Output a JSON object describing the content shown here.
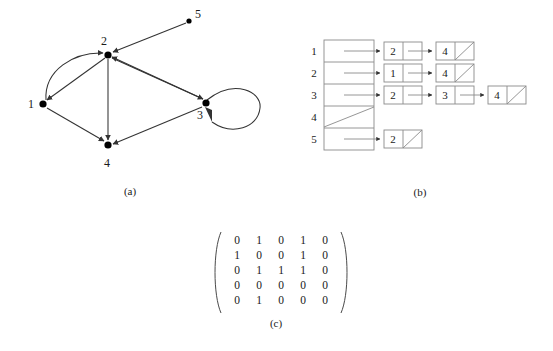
{
  "figure": {
    "captions": {
      "a": "(a)",
      "b": "(b)",
      "c": "(c)"
    },
    "colors": {
      "stroke": "#4a4a4a",
      "node_fill": "#000000",
      "text": "#1a1a1a",
      "background": "#ffffff"
    }
  },
  "graph": {
    "nodes": [
      {
        "id": "1",
        "label": "1",
        "x": 43,
        "y": 104,
        "label_x": 31,
        "label_y": 107
      },
      {
        "id": "2",
        "label": "2",
        "x": 108,
        "y": 55,
        "label_x": 103,
        "label_y": 44
      },
      {
        "id": "3",
        "label": "3",
        "x": 206,
        "y": 103,
        "label_x": 198,
        "label_y": 119
      },
      {
        "id": "4",
        "label": "4",
        "x": 108,
        "y": 145,
        "label_x": 104,
        "label_y": 164
      },
      {
        "id": "5",
        "label": "5",
        "x": 189,
        "y": 21,
        "label_x": 196,
        "label_y": 18
      }
    ],
    "edges": [
      {
        "from": "1",
        "to": "2",
        "kind": "curved"
      },
      {
        "from": "2",
        "to": "1",
        "kind": "straight"
      },
      {
        "from": "1",
        "to": "4",
        "kind": "straight"
      },
      {
        "from": "2",
        "to": "4",
        "kind": "straight"
      },
      {
        "from": "2",
        "to": "3",
        "kind": "straight"
      },
      {
        "from": "3",
        "to": "2",
        "kind": "straight"
      },
      {
        "from": "3",
        "to": "4",
        "kind": "straight"
      },
      {
        "from": "3",
        "to": "3",
        "kind": "self-loop"
      },
      {
        "from": "5",
        "to": "2",
        "kind": "straight"
      }
    ]
  },
  "adjacency_lists": {
    "header_rows": [
      {
        "index": "1",
        "empty": false
      },
      {
        "index": "2",
        "empty": false
      },
      {
        "index": "3",
        "empty": false
      },
      {
        "index": "4",
        "empty": true
      },
      {
        "index": "5",
        "empty": false
      }
    ],
    "rows": [
      {
        "index": "1",
        "nodes": [
          "2",
          "4"
        ]
      },
      {
        "index": "2",
        "nodes": [
          "1",
          "4"
        ]
      },
      {
        "index": "3",
        "nodes": [
          "2",
          "3",
          "4"
        ]
      },
      {
        "index": "4",
        "nodes": []
      },
      {
        "index": "5",
        "nodes": [
          "2"
        ]
      }
    ]
  },
  "chart_data": {
    "type": "table",
    "title": "",
    "row_labels": [
      "1",
      "2",
      "3",
      "4",
      "5"
    ],
    "col_labels": [
      "1",
      "2",
      "3",
      "4",
      "5"
    ],
    "matrix": [
      [
        "0",
        "1",
        "0",
        "1",
        "0"
      ],
      [
        "1",
        "0",
        "0",
        "1",
        "0"
      ],
      [
        "0",
        "1",
        "1",
        "1",
        "0"
      ],
      [
        "0",
        "0",
        "0",
        "0",
        "0"
      ],
      [
        "0",
        "1",
        "0",
        "0",
        "0"
      ]
    ],
    "flat_values": [
      "0",
      "1",
      "0",
      "1",
      "0",
      "1",
      "0",
      "0",
      "1",
      "0",
      "0",
      "1",
      "1",
      "1",
      "0",
      "0",
      "0",
      "0",
      "0",
      "0",
      "0",
      "1",
      "0",
      "0",
      "0"
    ]
  }
}
